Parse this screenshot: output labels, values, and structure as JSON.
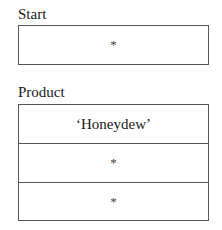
{
  "start": {
    "label": "Start",
    "cells": [
      "*"
    ]
  },
  "product": {
    "label": "Product",
    "cells": [
      "‘Honeydew’",
      "*",
      "*"
    ]
  }
}
